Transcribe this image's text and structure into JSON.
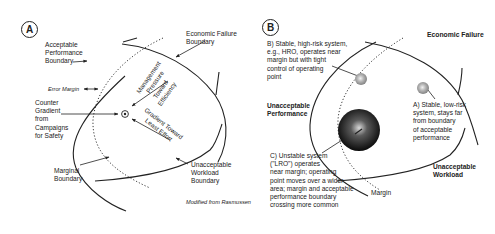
{
  "panel_a": {
    "badge": "A",
    "labels": {
      "acceptable_perf_boundary": [
        "Acceptable",
        "Performance",
        "Boundary"
      ],
      "economic_failure_boundary": [
        "Economic Failure",
        "Boundary"
      ],
      "error_margin": "Error Margin",
      "counter_gradient": [
        "Counter",
        "Gradient",
        "from",
        "Campaigns",
        "for Safety"
      ],
      "management_pressure": [
        "Management",
        "Pressure",
        "Toward",
        "Efficiency"
      ],
      "gradient_least_effort": [
        "Gradient Toward",
        "Least Effort"
      ],
      "marginal_boundary": [
        "Marginal",
        "Boundary"
      ],
      "unacceptable_workload_boundary": [
        "Unacceptable",
        "Workload",
        "Boundary"
      ],
      "credit": "Modified from Rasmussen"
    }
  },
  "panel_b": {
    "badge": "B",
    "labels": {
      "economic_failure": "Economic Failure",
      "hro_note": [
        "B) Stable, high-risk system,",
        "e.g., HRO, operates near",
        "margin but with tight",
        "control of operating",
        "point"
      ],
      "unacceptable_performance": [
        "Unacceptable",
        "Performance"
      ],
      "low_risk_note": [
        "A) Stable, low-risk",
        "system, stays far",
        "from boundary",
        "of acceptable",
        "performance"
      ],
      "unstable_note": [
        "C) Unstable system",
        "(\"LRO\") operates",
        "near margin; operating",
        "point moves over a wider",
        "area; margin and acceptable",
        "performance boundary",
        "crossing more common"
      ],
      "unacceptable_workload": [
        "Unacceptable",
        "Workload"
      ],
      "margin": "Margin"
    }
  }
}
